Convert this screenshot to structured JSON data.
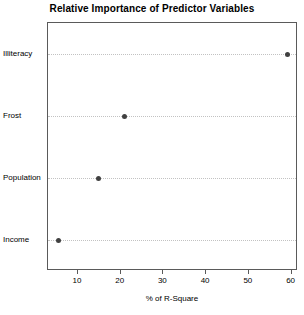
{
  "chart_data": {
    "type": "scatter",
    "subtype": "dotchart",
    "title": "Relative Importance of Predictor Variables",
    "xlabel": "% of R-Square",
    "ylabel": "",
    "categories": [
      "Income",
      "Population",
      "Frost",
      "Illiteracy"
    ],
    "values": [
      5.5,
      14.7,
      20.8,
      59.0
    ],
    "points": [
      {
        "category": "Illiteracy",
        "value": 59.0
      },
      {
        "category": "Frost",
        "value": 20.8
      },
      {
        "category": "Population",
        "value": 14.7
      },
      {
        "category": "Income",
        "value": 5.5
      }
    ],
    "xlim": [
      3.0,
      61.5
    ],
    "ylim_categories_top_to_bottom": [
      "Illiteracy",
      "Frost",
      "Population",
      "Income"
    ],
    "xticks": [
      10,
      20,
      30,
      40,
      50,
      60
    ],
    "xtick_labels": [
      "10",
      "20",
      "30",
      "40",
      "50",
      "60"
    ],
    "grid": "dotted-horizontal-per-category",
    "legend": "none",
    "colors": {
      "point": "#404040",
      "grid": "#c2c2c2",
      "axis": "#5a5a5a",
      "background": "#ffffff",
      "text": "#000000"
    }
  }
}
